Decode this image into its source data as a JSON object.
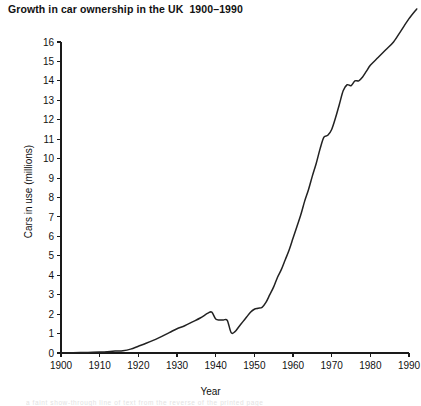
{
  "figure": {
    "title": "Growth in car ownership in the UK  1900–1990",
    "background_color": "#ffffff",
    "line_color": "#222222",
    "axis_color": "#1a1a1a",
    "faint_bleed_text": "a faint show-through line of text from the reverse of the printed page"
  },
  "chart_data": {
    "type": "line",
    "title": "Growth in car ownership in the UK  1900–1990",
    "xlabel": "Year",
    "ylabel": "Cars in use (millions)",
    "xlim": [
      1900,
      1990
    ],
    "ylim": [
      0,
      16
    ],
    "grid": false,
    "legend": null,
    "x_ticks": [
      1900,
      1910,
      1920,
      1930,
      1940,
      1950,
      1960,
      1970,
      1980,
      1990
    ],
    "y_ticks": [
      0,
      1,
      2,
      3,
      4,
      5,
      6,
      7,
      8,
      9,
      10,
      11,
      12,
      13,
      14,
      15,
      16
    ],
    "series": [
      {
        "name": "Cars in use (millions)",
        "x": [
          1900,
          1905,
          1910,
          1914,
          1916,
          1918,
          1920,
          1922,
          1925,
          1928,
          1930,
          1932,
          1934,
          1936,
          1938,
          1939,
          1940,
          1941,
          1942,
          1943,
          1944,
          1945,
          1946,
          1947,
          1948,
          1949,
          1950,
          1951,
          1952,
          1953,
          1954,
          1955,
          1956,
          1957,
          1958,
          1959,
          1960,
          1961,
          1962,
          1963,
          1964,
          1965,
          1966,
          1967,
          1968,
          1969,
          1970,
          1971,
          1972,
          1973,
          1974,
          1975,
          1976,
          1977,
          1978,
          1979,
          1980,
          1982,
          1984,
          1986,
          1988,
          1990,
          1992
        ],
        "y": [
          0.0,
          0.02,
          0.05,
          0.1,
          0.12,
          0.2,
          0.35,
          0.5,
          0.75,
          1.05,
          1.25,
          1.4,
          1.6,
          1.8,
          2.05,
          2.1,
          1.75,
          1.7,
          1.7,
          1.68,
          1.05,
          1.1,
          1.35,
          1.6,
          1.85,
          2.1,
          2.25,
          2.3,
          2.35,
          2.6,
          3.0,
          3.4,
          3.9,
          4.3,
          4.8,
          5.3,
          5.9,
          6.5,
          7.1,
          7.8,
          8.4,
          9.1,
          9.75,
          10.5,
          11.1,
          11.2,
          11.5,
          12.1,
          12.8,
          13.5,
          13.8,
          13.75,
          14.0,
          14.0,
          14.2,
          14.5,
          14.8,
          15.2,
          15.6,
          16.0,
          16.6,
          17.2,
          17.7
        ]
      }
    ],
    "annotations": [
      {
        "label": "pre-WWI near-zero ownership",
        "x_range": [
          1900,
          1914
        ]
      },
      {
        "label": "inter-war peak",
        "x": 1938,
        "y": 2.1
      },
      {
        "label": "WWII trough",
        "x": 1944,
        "y": 1.05
      },
      {
        "label": "post-war rapid growth",
        "x_range": [
          1950,
          1973
        ]
      },
      {
        "label": "oil-crisis plateau",
        "x_range": [
          1974,
          1978
        ]
      }
    ]
  },
  "axes": {
    "y_title": "Cars in use (millions)",
    "x_title": "Year"
  }
}
